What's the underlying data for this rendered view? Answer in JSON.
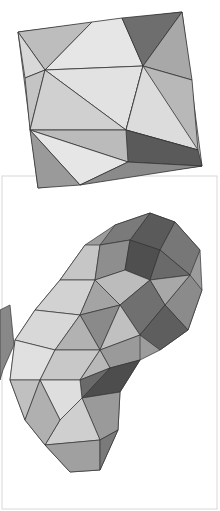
{
  "artwork": {
    "top_drawing": {
      "subject": "tilted square with triangulated pencil shading",
      "tone": "grayscale"
    },
    "bottom_drawing": {
      "subject": "blob shape with triangulated pencil shading on white card",
      "tone": "grayscale"
    },
    "colors": {
      "background": "#ffffff",
      "line": "#333333",
      "card_border": "#d8d8d8"
    }
  }
}
